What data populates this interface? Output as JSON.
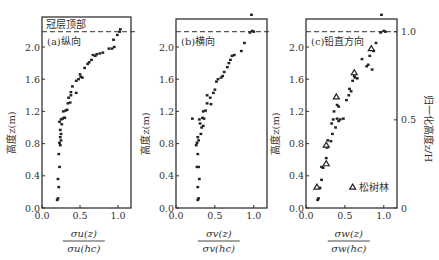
{
  "chart_data": [
    {
      "type": "scatter",
      "panel_label": "(a)纵向",
      "annotation": "冠层顶部",
      "xlabel_num": "σu(z)",
      "xlabel_den": "σu(hc)",
      "ylabel": "高度z(m)",
      "xlim": [
        0.0,
        1.17
      ],
      "ylim": [
        0.0,
        2.5
      ],
      "xticks": [
        "0.0",
        "0.5",
        "1.0"
      ],
      "yticks": [
        "0.0",
        "0.4",
        "0.8",
        "1.2",
        "1.6",
        "2.0"
      ],
      "canopy_top_z": 2.19,
      "grid": false,
      "series": [
        {
          "name": "松树林",
          "marker": "square",
          "points": [
            [
              0.2,
              0.1
            ],
            [
              0.21,
              0.12
            ],
            [
              0.22,
              0.26
            ],
            [
              0.21,
              0.36
            ],
            [
              0.23,
              0.51
            ],
            [
              0.22,
              0.67
            ],
            [
              0.24,
              0.78
            ],
            [
              0.23,
              0.81
            ],
            [
              0.25,
              0.84
            ],
            [
              0.24,
              0.88
            ],
            [
              0.25,
              0.92
            ],
            [
              0.24,
              0.97
            ],
            [
              0.26,
              1.04
            ],
            [
              0.23,
              1.07
            ],
            [
              0.25,
              1.1
            ],
            [
              0.27,
              1.11
            ],
            [
              0.29,
              1.12
            ],
            [
              0.3,
              1.12
            ],
            [
              0.28,
              1.2
            ],
            [
              0.31,
              1.21
            ],
            [
              0.33,
              1.22
            ],
            [
              0.34,
              1.3
            ],
            [
              0.37,
              1.31
            ],
            [
              0.35,
              1.37
            ],
            [
              0.38,
              1.4
            ],
            [
              0.38,
              1.44
            ],
            [
              0.45,
              1.43
            ],
            [
              0.4,
              1.51
            ],
            [
              0.45,
              1.58
            ],
            [
              0.48,
              1.6
            ],
            [
              0.51,
              1.63
            ],
            [
              0.5,
              1.66
            ],
            [
              0.53,
              1.62
            ],
            [
              0.56,
              1.74
            ],
            [
              0.6,
              1.79
            ],
            [
              0.62,
              1.81
            ],
            [
              0.65,
              1.84
            ],
            [
              0.67,
              1.9
            ],
            [
              0.7,
              1.89
            ],
            [
              0.72,
              1.91
            ],
            [
              0.76,
              1.92
            ],
            [
              0.8,
              1.93
            ],
            [
              0.88,
              1.98
            ],
            [
              0.92,
              1.98
            ],
            [
              0.95,
              2.0
            ],
            [
              0.94,
              2.09
            ],
            [
              0.99,
              2.15
            ],
            [
              1.02,
              2.19
            ],
            [
              1.03,
              2.22
            ]
          ]
        }
      ]
    },
    {
      "type": "scatter",
      "panel_label": "(b)横向",
      "xlabel_num": "σv(z)",
      "xlabel_den": "σv(hc)",
      "ylabel": "高度z(m)",
      "xlim": [
        0.0,
        1.17
      ],
      "ylim": [
        0.0,
        2.5
      ],
      "xticks": [
        "0.0",
        "0.5",
        "1.0"
      ],
      "yticks": [
        "0.0",
        "0.4",
        "0.8",
        "1.2",
        "1.6",
        "2.0"
      ],
      "canopy_top_z": 2.19,
      "grid": false,
      "series": [
        {
          "name": "松树林",
          "marker": "square",
          "points": [
            [
              0.28,
              0.1
            ],
            [
              0.29,
              0.12
            ],
            [
              0.28,
              0.26
            ],
            [
              0.3,
              0.36
            ],
            [
              0.27,
              0.51
            ],
            [
              0.29,
              0.51
            ],
            [
              0.28,
              0.67
            ],
            [
              0.26,
              0.78
            ],
            [
              0.27,
              0.81
            ],
            [
              0.29,
              0.84
            ],
            [
              0.28,
              0.88
            ],
            [
              0.32,
              0.92
            ],
            [
              0.33,
              1.0
            ],
            [
              0.35,
              1.02
            ],
            [
              0.31,
              1.05
            ],
            [
              0.3,
              1.1
            ],
            [
              0.34,
              1.12
            ],
            [
              0.36,
              1.11
            ],
            [
              0.21,
              1.11
            ],
            [
              0.35,
              1.2
            ],
            [
              0.38,
              1.21
            ],
            [
              0.4,
              1.3
            ],
            [
              0.45,
              1.29
            ],
            [
              0.44,
              1.37
            ],
            [
              0.4,
              1.4
            ],
            [
              0.48,
              1.43
            ],
            [
              0.5,
              1.47
            ],
            [
              0.52,
              1.57
            ],
            [
              0.54,
              1.6
            ],
            [
              0.58,
              1.62
            ],
            [
              0.6,
              1.64
            ],
            [
              0.62,
              1.69
            ],
            [
              0.66,
              1.75
            ],
            [
              0.68,
              1.8
            ],
            [
              0.7,
              1.84
            ],
            [
              0.72,
              1.89
            ],
            [
              0.75,
              1.9
            ],
            [
              0.84,
              1.95
            ],
            [
              0.88,
              2.05
            ],
            [
              0.95,
              2.18
            ],
            [
              0.98,
              2.2
            ],
            [
              1.0,
              2.19
            ],
            [
              0.97,
              2.4
            ]
          ]
        }
      ]
    },
    {
      "type": "scatter",
      "panel_label": "(c)铅直方向",
      "xlabel_num": "σw(z)",
      "xlabel_den": "σw(hc)",
      "ylabel": "高度z(m)",
      "ylabel_right": "归一化高度z/H",
      "xlim": [
        0.0,
        1.17
      ],
      "ylim": [
        0.0,
        2.5
      ],
      "xticks": [
        "0.0",
        "0.5",
        "1.0"
      ],
      "yticks": [
        "0.0",
        "0.4",
        "0.8",
        "1.2",
        "1.6",
        "2.0"
      ],
      "yticks_right": [
        "0",
        "0.5",
        "1.0"
      ],
      "canopy_top_z": 2.19,
      "grid": false,
      "legend": {
        "label": "松树林",
        "position": "lower right"
      },
      "series": [
        {
          "name": "松树林",
          "marker": "square",
          "points": [
            [
              0.15,
              0.1
            ],
            [
              0.16,
              0.12
            ],
            [
              0.18,
              0.25
            ],
            [
              0.2,
              0.35
            ],
            [
              0.22,
              0.5
            ],
            [
              0.2,
              0.51
            ],
            [
              0.26,
              0.62
            ],
            [
              0.27,
              0.75
            ],
            [
              0.28,
              0.84
            ],
            [
              0.32,
              0.83
            ],
            [
              0.34,
              0.92
            ],
            [
              0.38,
              1.0
            ],
            [
              0.33,
              1.05
            ],
            [
              0.35,
              1.1
            ],
            [
              0.4,
              1.11
            ],
            [
              0.44,
              1.1
            ],
            [
              0.48,
              1.11
            ],
            [
              0.42,
              1.08
            ],
            [
              0.36,
              1.2
            ],
            [
              0.4,
              1.28
            ],
            [
              0.42,
              1.26
            ],
            [
              0.52,
              1.34
            ],
            [
              0.55,
              1.4
            ],
            [
              0.58,
              1.45
            ],
            [
              0.56,
              1.48
            ],
            [
              0.6,
              1.58
            ],
            [
              0.63,
              1.62
            ],
            [
              0.66,
              1.61
            ],
            [
              0.62,
              1.64
            ],
            [
              0.72,
              1.85
            ],
            [
              0.78,
              1.76
            ],
            [
              0.8,
              1.78
            ],
            [
              0.85,
              1.72
            ],
            [
              0.82,
              1.89
            ],
            [
              0.87,
              1.95
            ],
            [
              0.9,
              2.05
            ],
            [
              0.96,
              2.18
            ],
            [
              1.0,
              2.2
            ],
            [
              1.02,
              2.19
            ],
            [
              0.97,
              2.4
            ]
          ]
        },
        {
          "name": "松树林(三角)",
          "marker": "triangle",
          "points": [
            [
              0.14,
              0.26
            ],
            [
              0.26,
              0.55
            ],
            [
              0.26,
              0.78
            ],
            [
              0.39,
              1.38
            ],
            [
              0.62,
              1.68
            ],
            [
              0.84,
              1.98
            ]
          ]
        }
      ]
    }
  ],
  "legend_marker": "triangle",
  "colors": {
    "ink": "#222222",
    "axis": "#333333",
    "background": "#ffffff"
  }
}
